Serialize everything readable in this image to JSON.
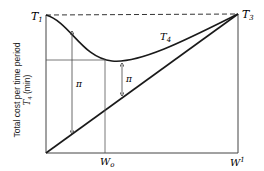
{
  "diagram": {
    "labels": {
      "top_left": "T",
      "top_left_sub": "1",
      "top_right": "T",
      "top_right_sub": "3",
      "curve": "T",
      "curve_sub": "4",
      "x_mid": "W",
      "x_mid_sub": "o",
      "x_right": "W",
      "x_right_sup": "1",
      "pi_left": "π",
      "pi_right": "π"
    },
    "y_axis_label": {
      "line1": "Total cost per time period",
      "line2_main": "T",
      "line2_sub": "4",
      "line2_rest": " (min)"
    },
    "colors": {
      "line": "#1a1a1a",
      "thin_line": "#555555",
      "background": "#ffffff"
    }
  }
}
